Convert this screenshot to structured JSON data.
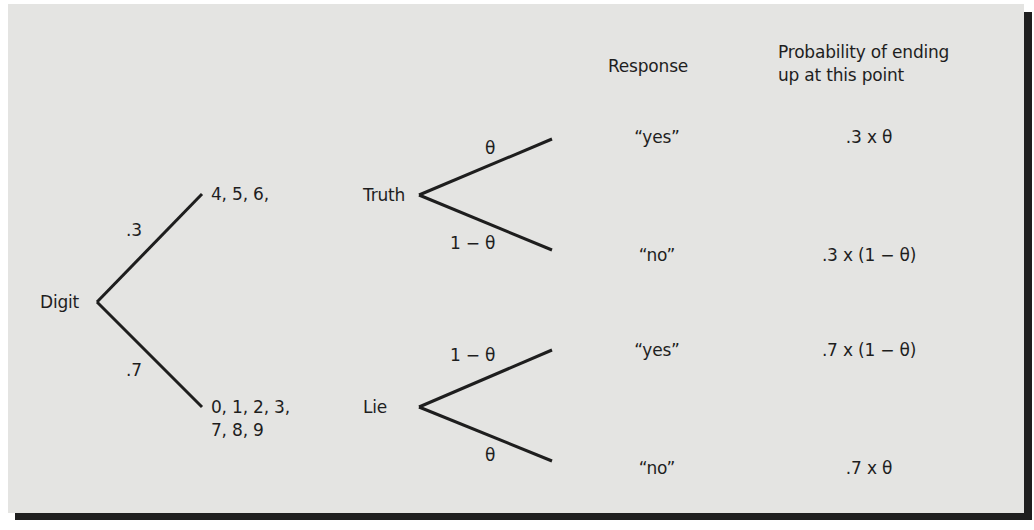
{
  "diagram": {
    "type": "probability-tree",
    "headers": {
      "response": "Response",
      "probability_line1": "Probability of ending",
      "probability_line2": "up at this point"
    },
    "root": {
      "label": "Digit"
    },
    "level1": {
      "upper": {
        "branch_prob": ".3",
        "outcome_label": "4, 5, 6,"
      },
      "lower": {
        "branch_prob": ".7",
        "outcome_line1": "0, 1, 2, 3,",
        "outcome_line2": "7, 8, 9"
      }
    },
    "level2": {
      "truth": {
        "label": "Truth",
        "upper_prob": "θ",
        "lower_prob": "1 − θ"
      },
      "lie": {
        "label": "Lie",
        "upper_prob": "1 − θ",
        "lower_prob": "θ"
      }
    },
    "leaves": [
      {
        "response": "“yes”",
        "probability": ".3 x θ"
      },
      {
        "response": "“no”",
        "probability": ".3 x (1 − θ)"
      },
      {
        "response": "“yes”",
        "probability": ".7 x (1 − θ)"
      },
      {
        "response": "“no”",
        "probability": ".7 x θ"
      }
    ],
    "colors": {
      "background": "#e4e4e2",
      "ink": "#1e1e1e",
      "border": "#1f1f1f"
    }
  }
}
